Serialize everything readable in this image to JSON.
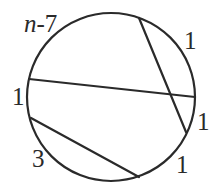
{
  "diagram": {
    "type": "circle-with-chords",
    "circle": {
      "cx": 111,
      "cy": 97,
      "r": 84
    },
    "chords": [
      {
        "id": "chord-horizontal",
        "x1": 29,
        "y1": 79,
        "x2": 195,
        "y2": 97
      },
      {
        "id": "chord-steep",
        "x1": 139,
        "y1": 18,
        "x2": 186,
        "y2": 132
      },
      {
        "id": "chord-lower",
        "x1": 31,
        "y1": 118,
        "x2": 139,
        "y2": 177
      }
    ],
    "labels": [
      {
        "id": "arc-label-top-left",
        "var": "n",
        "rest": "-7",
        "x": 24,
        "y": 32
      },
      {
        "id": "arc-label-top-right",
        "text": "1",
        "x": 184,
        "y": 49
      },
      {
        "id": "arc-label-left",
        "text": "1",
        "x": 12,
        "y": 105
      },
      {
        "id": "arc-label-right",
        "text": "1",
        "x": 197,
        "y": 130
      },
      {
        "id": "arc-label-bottom-right",
        "text": "1",
        "x": 176,
        "y": 173
      },
      {
        "id": "arc-label-bottom-left",
        "text": "3",
        "x": 32,
        "y": 167
      }
    ]
  }
}
